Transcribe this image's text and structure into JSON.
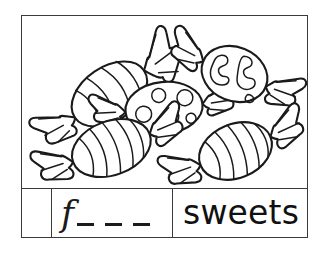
{
  "worksheet": {
    "type": "phonics-initial-sound-worksheet",
    "picture_panel": {
      "scene_description": "five wrapped sweets",
      "item_count": 5,
      "items": [
        {
          "name": "candy-oval-lined",
          "pattern": "vertical-lines",
          "position": "top-left"
        },
        {
          "name": "candy-polka-dot",
          "pattern": "polka-dots",
          "position": "middle-center"
        },
        {
          "name": "candy-blob-pattern",
          "pattern": "irregular-blobs",
          "position": "top-right"
        },
        {
          "name": "candy-striped-left",
          "pattern": "stripes",
          "position": "bottom-left"
        },
        {
          "name": "candy-striped-right",
          "pattern": "stripes",
          "position": "bottom-right"
        }
      ]
    },
    "answer_row": {
      "number_cell_value": "",
      "initial_letter": "f",
      "blank_count": 3,
      "word": "sweets"
    },
    "colors": {
      "ink": "#1a1a1a",
      "border": "#3a3a3a",
      "background": "#ffffff"
    }
  }
}
